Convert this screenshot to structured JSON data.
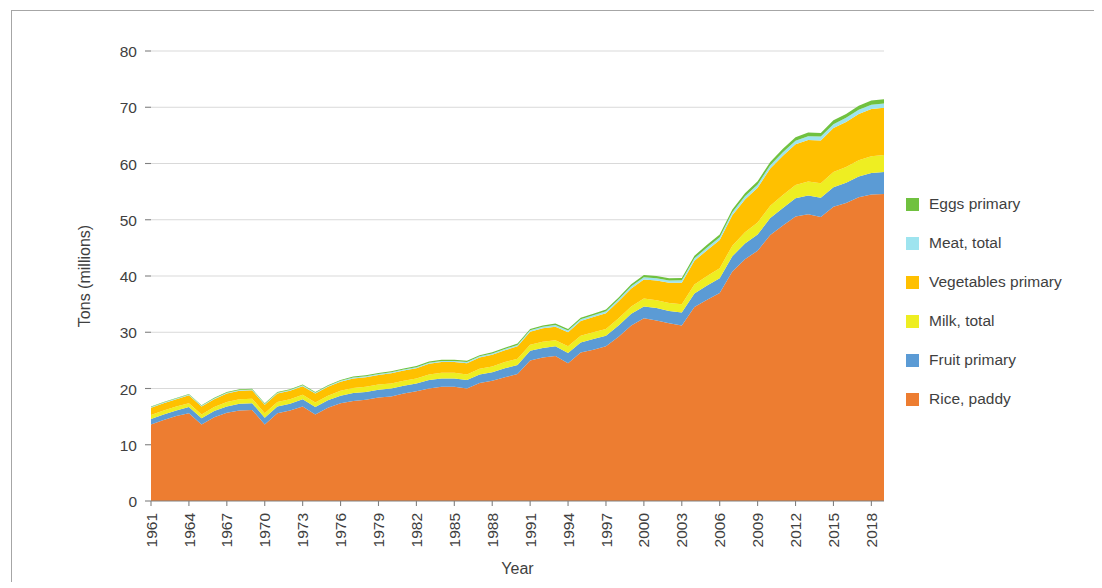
{
  "chart_data": {
    "type": "area",
    "stacked": true,
    "title": "",
    "xlabel": "Year",
    "ylabel": "Tons (millions)",
    "xlim": [
      1961,
      2019
    ],
    "ylim": [
      0,
      80
    ],
    "yticks": [
      0,
      10,
      20,
      30,
      40,
      50,
      60,
      70,
      80
    ],
    "ytick_labels": [
      "0",
      "10",
      "20",
      "30",
      "40",
      "50",
      "60",
      "70",
      "80"
    ],
    "xticks": [
      1961,
      1964,
      1967,
      1970,
      1973,
      1976,
      1979,
      1982,
      1985,
      1988,
      1991,
      1994,
      1997,
      2000,
      2003,
      2006,
      2009,
      2012,
      2015,
      2018
    ],
    "xtick_labels": [
      "1961",
      "1964",
      "1967",
      "1970",
      "1973",
      "1976",
      "1979",
      "1982",
      "1985",
      "1988",
      "1991",
      "1994",
      "1997",
      "2000",
      "2003",
      "2006",
      "2009",
      "2012",
      "2015",
      "2018"
    ],
    "grid": true,
    "grid_axis": "y",
    "legend_position": "right",
    "x": [
      1961,
      1962,
      1963,
      1964,
      1965,
      1966,
      1967,
      1968,
      1969,
      1970,
      1971,
      1972,
      1973,
      1974,
      1975,
      1976,
      1977,
      1978,
      1979,
      1980,
      1981,
      1982,
      1983,
      1984,
      1985,
      1986,
      1987,
      1988,
      1989,
      1990,
      1991,
      1992,
      1993,
      1994,
      1995,
      1996,
      1997,
      1998,
      1999,
      2000,
      2001,
      2002,
      2003,
      2004,
      2005,
      2006,
      2007,
      2008,
      2009,
      2010,
      2011,
      2012,
      2013,
      2014,
      2015,
      2016,
      2017,
      2018,
      2019
    ],
    "series": [
      {
        "name": "Rice, paddy",
        "color": "#ED7D31",
        "values": [
          13.6,
          14.4,
          15.1,
          15.6,
          13.6,
          14.9,
          15.7,
          16.1,
          16.2,
          13.6,
          15.6,
          16.1,
          16.8,
          15.4,
          16.6,
          17.4,
          17.8,
          18.0,
          18.4,
          18.6,
          19.1,
          19.5,
          20.0,
          20.3,
          20.3,
          20.0,
          21.0,
          21.4,
          22.0,
          22.6,
          25.0,
          25.5,
          25.8,
          24.5,
          26.4,
          26.9,
          27.5,
          29.2,
          31.2,
          32.5,
          32.1,
          31.6,
          31.2,
          34.5,
          35.8,
          37.0,
          40.8,
          43.0,
          44.5,
          47.3,
          49.0,
          50.6,
          51.0,
          50.5,
          52.3,
          53.0,
          54.0,
          54.5,
          54.6
        ]
      },
      {
        "name": "Fruit primary",
        "color": "#5B9BD5",
        "values": [
          1.0,
          1.0,
          1.0,
          1.1,
          1.1,
          1.1,
          1.1,
          1.2,
          1.2,
          1.2,
          1.2,
          1.2,
          1.3,
          1.3,
          1.3,
          1.3,
          1.4,
          1.4,
          1.4,
          1.4,
          1.4,
          1.4,
          1.5,
          1.5,
          1.5,
          1.5,
          1.5,
          1.5,
          1.6,
          1.6,
          1.7,
          1.7,
          1.7,
          1.8,
          1.8,
          1.9,
          1.9,
          2.0,
          2.1,
          2.1,
          2.2,
          2.2,
          2.3,
          2.4,
          2.5,
          2.6,
          2.7,
          2.8,
          2.9,
          3.0,
          3.1,
          3.2,
          3.3,
          3.4,
          3.5,
          3.6,
          3.7,
          3.8,
          3.9
        ]
      },
      {
        "name": "Milk, total",
        "color": "#EEEE22",
        "values": [
          0.7,
          0.7,
          0.7,
          0.7,
          0.7,
          0.7,
          0.8,
          0.8,
          0.8,
          0.8,
          0.8,
          0.8,
          0.8,
          0.8,
          0.8,
          0.9,
          0.9,
          0.9,
          0.9,
          0.9,
          0.9,
          0.9,
          1.0,
          1.0,
          1.0,
          1.0,
          1.0,
          1.0,
          1.1,
          1.1,
          1.1,
          1.1,
          1.1,
          1.2,
          1.2,
          1.2,
          1.2,
          1.3,
          1.3,
          1.4,
          1.4,
          1.4,
          1.5,
          1.6,
          1.7,
          1.8,
          1.9,
          2.0,
          2.1,
          2.2,
          2.3,
          2.4,
          2.5,
          2.6,
          2.7,
          2.8,
          2.9,
          3.0,
          3.0
        ]
      },
      {
        "name": "Vegetables primary",
        "color": "#FFC000",
        "values": [
          1.3,
          1.3,
          1.3,
          1.4,
          1.4,
          1.4,
          1.5,
          1.5,
          1.5,
          1.5,
          1.5,
          1.5,
          1.5,
          1.6,
          1.6,
          1.6,
          1.7,
          1.7,
          1.7,
          1.8,
          1.8,
          1.8,
          1.9,
          1.9,
          1.9,
          2.0,
          2.0,
          2.1,
          2.1,
          2.2,
          2.3,
          2.4,
          2.4,
          2.5,
          2.6,
          2.7,
          2.8,
          3.0,
          3.2,
          3.4,
          3.5,
          3.6,
          3.8,
          4.2,
          4.6,
          5.0,
          5.4,
          5.8,
          6.2,
          6.6,
          7.0,
          7.2,
          7.4,
          7.6,
          7.8,
          8.0,
          8.2,
          8.4,
          8.4
        ]
      },
      {
        "name": "Meat, total",
        "color": "#9EE4EF",
        "values": [
          0.12,
          0.12,
          0.12,
          0.13,
          0.13,
          0.13,
          0.14,
          0.14,
          0.14,
          0.15,
          0.15,
          0.15,
          0.16,
          0.16,
          0.16,
          0.17,
          0.17,
          0.18,
          0.18,
          0.19,
          0.19,
          0.2,
          0.2,
          0.21,
          0.21,
          0.22,
          0.22,
          0.23,
          0.24,
          0.25,
          0.26,
          0.27,
          0.28,
          0.29,
          0.3,
          0.31,
          0.33,
          0.35,
          0.37,
          0.39,
          0.4,
          0.41,
          0.43,
          0.45,
          0.48,
          0.5,
          0.53,
          0.56,
          0.58,
          0.6,
          0.62,
          0.64,
          0.66,
          0.68,
          0.7,
          0.72,
          0.74,
          0.76,
          0.78
        ]
      },
      {
        "name": "Eggs primary",
        "color": "#70C13F",
        "values": [
          0.1,
          0.1,
          0.1,
          0.11,
          0.11,
          0.11,
          0.12,
          0.12,
          0.12,
          0.13,
          0.13,
          0.13,
          0.14,
          0.14,
          0.14,
          0.15,
          0.15,
          0.16,
          0.16,
          0.17,
          0.17,
          0.18,
          0.18,
          0.19,
          0.19,
          0.2,
          0.2,
          0.21,
          0.22,
          0.23,
          0.24,
          0.25,
          0.26,
          0.27,
          0.28,
          0.29,
          0.31,
          0.33,
          0.35,
          0.37,
          0.38,
          0.39,
          0.41,
          0.43,
          0.46,
          0.48,
          0.51,
          0.54,
          0.56,
          0.58,
          0.6,
          0.62,
          0.64,
          0.66,
          0.68,
          0.7,
          0.72,
          0.74,
          0.76
        ]
      }
    ]
  },
  "legend": {
    "items": [
      {
        "label": "Eggs primary",
        "color": "#70C13F"
      },
      {
        "label": "Meat, total",
        "color": "#9EE4EF"
      },
      {
        "label": "Vegetables primary",
        "color": "#FFC000"
      },
      {
        "label": "Milk, total",
        "color": "#EEEE22"
      },
      {
        "label": "Fruit primary",
        "color": "#5B9BD5"
      },
      {
        "label": "Rice, paddy",
        "color": "#ED7D31"
      }
    ]
  }
}
